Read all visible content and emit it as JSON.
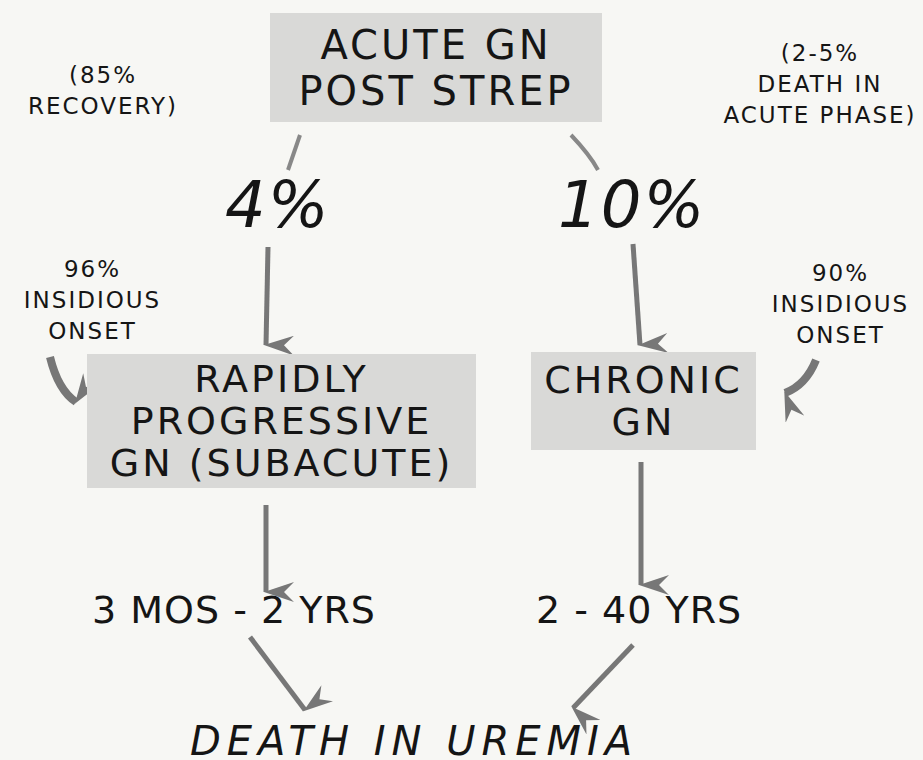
{
  "diagram": {
    "top_box": {
      "lines": [
        "ACUTE GN",
        "POST STREP"
      ]
    },
    "left_note": {
      "lines": [
        "(85%",
        "RECOVERY)"
      ]
    },
    "right_note": {
      "lines": [
        "(2-5%",
        "DEATH IN",
        "ACUTE PHASE)"
      ]
    },
    "left_pct": "4%",
    "right_pct": "10%",
    "left_onset": {
      "lines": [
        "96%",
        "INSIDIOUS",
        "ONSET"
      ]
    },
    "right_onset": {
      "lines": [
        "90%",
        "INSIDIOUS",
        "ONSET"
      ]
    },
    "rp_box": {
      "lines": [
        "RAPIDLY",
        "PROGRESSIVE",
        "GN (SUBACUTE)"
      ]
    },
    "chronic_box": {
      "lines": [
        "CHRONIC",
        "GN"
      ]
    },
    "left_duration": "3 MOS - 2 YRS",
    "right_duration": "2 - 40 YRS",
    "outcome": "DEATH IN UREMIA",
    "colors": {
      "box_fill": "#d9d9d7",
      "arrow": "#777777",
      "text": "#151515",
      "background": "#f7f7f4"
    }
  }
}
